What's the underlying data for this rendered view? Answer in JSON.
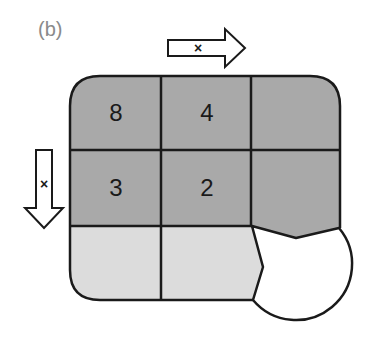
{
  "figure": {
    "panel_label": "(b)",
    "colors": {
      "dark_cell": "#a9a9a9",
      "light_cell": "#dcdcdc",
      "stroke": "#1a1a1a",
      "background": "#ffffff"
    },
    "grid": {
      "rows": 3,
      "cols": 3,
      "cells": [
        {
          "row": 0,
          "col": 0,
          "value": "8",
          "shade": "dark"
        },
        {
          "row": 0,
          "col": 1,
          "value": "4",
          "shade": "dark"
        },
        {
          "row": 0,
          "col": 2,
          "value": "",
          "shade": "dark"
        },
        {
          "row": 1,
          "col": 0,
          "value": "3",
          "shade": "dark"
        },
        {
          "row": 1,
          "col": 1,
          "value": "2",
          "shade": "dark"
        },
        {
          "row": 1,
          "col": 2,
          "value": "",
          "shade": "dark"
        },
        {
          "row": 2,
          "col": 0,
          "value": "",
          "shade": "light"
        },
        {
          "row": 2,
          "col": 1,
          "value": "",
          "shade": "light"
        },
        {
          "row": 2,
          "col": 2,
          "value": "",
          "shade": "removed-circle"
        }
      ]
    },
    "arrows": [
      {
        "direction": "right",
        "mark": "×"
      },
      {
        "direction": "down",
        "mark": "×"
      }
    ]
  }
}
